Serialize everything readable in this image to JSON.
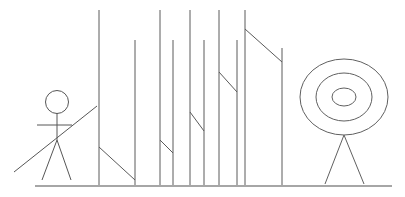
{
  "canvas": {
    "width": 405,
    "height": 197,
    "background": "#ffffff",
    "stroke_color": "#5a5a5a",
    "description": "Hand-drawn style line sketch: an archer stick figure on the left aiming a bow, a row of block letter N shapes in the middle, and a concentric-circle target on a tripod stand at the right, all standing on a horizontal ground line."
  },
  "ground": {
    "name": "ground-line",
    "x1": 35,
    "y1": 186,
    "x2": 392,
    "y2": 186,
    "color": "#4f4f4f"
  },
  "archer": {
    "name": "archer-figure",
    "color": "#565656",
    "head": {
      "cx": 57,
      "cy": 102,
      "rx": 11.5,
      "ry": 11.5
    },
    "spine": {
      "x1": 57,
      "y1": 113,
      "x2": 57,
      "y2": 140
    },
    "arms": {
      "x1": 37,
      "y1": 125,
      "x2": 72,
      "y2": 125
    },
    "leg_left": {
      "x1": 57,
      "y1": 140,
      "x2": 42,
      "y2": 180
    },
    "leg_right": {
      "x1": 57,
      "y1": 140,
      "x2": 71,
      "y2": 180
    },
    "bow": {
      "x1": 14,
      "y1": 172,
      "x2": 97,
      "y2": 106
    }
  },
  "letters": {
    "name": "letter-row",
    "text": "NNNNN",
    "count": 5,
    "color": "#5a5a5a",
    "items": [
      {
        "label": "N",
        "left_stem": {
          "x": 99,
          "y_top": 10,
          "y_bottom": 185
        },
        "right_stem": {
          "x": 135,
          "y_top": 40,
          "y_bottom": 185
        },
        "diagonal": {
          "x1": 99,
          "y1": 147,
          "x2": 135,
          "y2": 180
        }
      },
      {
        "label": "N",
        "left_stem": {
          "x": 160,
          "y_top": 10,
          "y_bottom": 185
        },
        "right_stem": {
          "x": 173,
          "y_top": 40,
          "y_bottom": 185
        },
        "diagonal": {
          "x1": 160,
          "y1": 140,
          "x2": 173,
          "y2": 153
        }
      },
      {
        "label": "N",
        "left_stem": {
          "x": 190,
          "y_top": 10,
          "y_bottom": 185
        },
        "right_stem": {
          "x": 204,
          "y_top": 40,
          "y_bottom": 185
        },
        "diagonal": {
          "x1": 190,
          "y1": 112,
          "x2": 204,
          "y2": 131
        }
      },
      {
        "label": "N",
        "left_stem": {
          "x": 219,
          "y_top": 10,
          "y_bottom": 185
        },
        "right_stem": {
          "x": 237,
          "y_top": 40,
          "y_bottom": 185
        },
        "diagonal": {
          "x1": 219,
          "y1": 72,
          "x2": 237,
          "y2": 92
        }
      },
      {
        "label": "N",
        "left_stem": {
          "x": 245,
          "y_top": 10,
          "y_bottom": 185
        },
        "right_stem": {
          "x": 282,
          "y_top": 48,
          "y_bottom": 185
        },
        "diagonal": {
          "x1": 245,
          "y1": 29,
          "x2": 282,
          "y2": 62
        }
      }
    ]
  },
  "target": {
    "name": "bullseye-target",
    "color": "#606060",
    "rings": [
      {
        "label": "outer-ring",
        "cx": 344,
        "cy": 97,
        "rx": 44,
        "ry": 38
      },
      {
        "label": "middle-ring",
        "cx": 344,
        "cy": 97,
        "rx": 28,
        "ry": 24
      },
      {
        "label": "inner-ring",
        "cx": 344,
        "cy": 97,
        "rx": 12,
        "ry": 9
      }
    ],
    "stand": {
      "label": "target-tripod-stand",
      "apex": {
        "x": 344,
        "y": 135
      },
      "left_leg_end": {
        "x": 325,
        "y": 184
      },
      "right_leg_end": {
        "x": 364,
        "y": 184
      }
    }
  }
}
